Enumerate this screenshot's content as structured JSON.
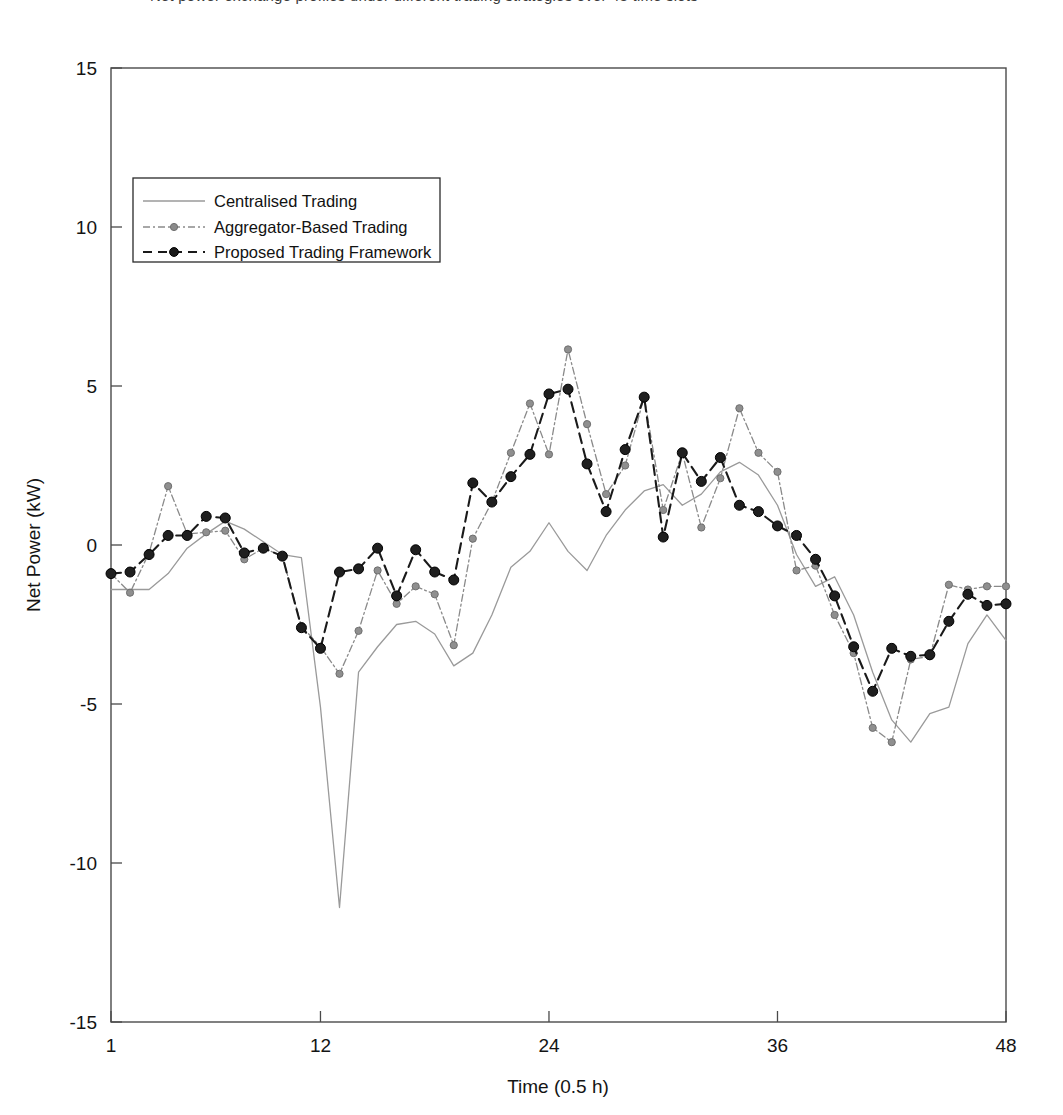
{
  "caption": {
    "text": "Net power exchange profiles under different trading strategies over 48 time slots",
    "visible_state": "cropped-at-top"
  },
  "chart_data": {
    "type": "line",
    "title": "",
    "xlabel": "Time (0.5 h)",
    "ylabel": "Net Power (kW)",
    "xlim": [
      1,
      48
    ],
    "ylim": [
      -15,
      15
    ],
    "xticks": [
      1,
      12,
      24,
      36,
      48
    ],
    "yticks": [
      15,
      10,
      5,
      0,
      -5,
      -10,
      -15
    ],
    "xtick_labels": [
      "1",
      "12",
      "24",
      "36",
      "48"
    ],
    "ytick_labels": [
      "15",
      "10",
      "5",
      "0",
      "-5",
      "-10",
      "-15"
    ],
    "grid": false,
    "legend_position": "upper-left-inside",
    "x": [
      1,
      2,
      3,
      4,
      5,
      6,
      7,
      8,
      9,
      10,
      11,
      12,
      13,
      14,
      15,
      16,
      17,
      18,
      19,
      20,
      21,
      22,
      23,
      24,
      25,
      26,
      27,
      28,
      29,
      30,
      31,
      32,
      33,
      34,
      35,
      36,
      37,
      38,
      39,
      40,
      41,
      42,
      43,
      44,
      45,
      46,
      47,
      48
    ],
    "series": [
      {
        "name": "Centralised Trading",
        "style": "solid",
        "color": "#9a9a9a",
        "marker": "none",
        "values": [
          -1.4,
          -1.4,
          -1.4,
          -0.9,
          -0.1,
          0.35,
          0.75,
          0.5,
          0.1,
          -0.3,
          -0.4,
          -5.1,
          -11.4,
          -4.0,
          -3.2,
          -2.5,
          -2.4,
          -2.8,
          -3.8,
          -3.4,
          -2.2,
          -0.7,
          -0.2,
          0.7,
          -0.2,
          -0.8,
          0.3,
          1.1,
          1.7,
          1.9,
          1.25,
          1.6,
          2.3,
          2.6,
          2.2,
          1.25,
          -0.3,
          -1.3,
          -1.0,
          -2.2,
          -4.0,
          -5.5,
          -6.2,
          -5.3,
          -5.1,
          -3.1,
          -2.2,
          -3.0
        ]
      },
      {
        "name": "Aggregator-Based Trading",
        "style": "dashdot",
        "color": "#8a8a8a",
        "marker": "circle-filled-gray",
        "values": [
          -0.9,
          -1.5,
          -0.25,
          1.85,
          0.35,
          0.4,
          0.45,
          -0.45,
          -0.1,
          -0.35,
          -2.55,
          -3.2,
          -4.05,
          -2.7,
          -0.8,
          -1.85,
          -1.3,
          -1.55,
          -3.15,
          0.2,
          1.35,
          2.9,
          4.45,
          2.85,
          6.15,
          3.8,
          1.6,
          2.5,
          4.65,
          1.1,
          2.9,
          0.55,
          2.1,
          4.3,
          2.9,
          2.3,
          -0.8,
          -0.65,
          -2.2,
          -3.4,
          -5.75,
          -6.2,
          -3.6,
          -3.5,
          -1.25,
          -1.4,
          -1.3,
          -1.3
        ]
      },
      {
        "name": "Proposed Trading Framework",
        "style": "dashed",
        "color": "#1a1a1a",
        "marker": "circle-filled-black",
        "values": [
          -0.9,
          -0.85,
          -0.3,
          0.3,
          0.3,
          0.9,
          0.85,
          -0.25,
          -0.1,
          -0.35,
          -2.6,
          -3.25,
          -0.85,
          -0.75,
          -0.1,
          -1.6,
          -0.15,
          -0.85,
          -1.1,
          1.95,
          1.35,
          2.15,
          2.85,
          4.75,
          4.9,
          2.55,
          1.05,
          3.0,
          4.65,
          0.25,
          2.9,
          2.0,
          2.75,
          1.25,
          1.05,
          0.6,
          0.3,
          -0.45,
          -1.6,
          -3.2,
          -4.6,
          -3.25,
          -3.5,
          -3.45,
          -2.4,
          -1.55,
          -1.9,
          -1.85
        ]
      }
    ]
  },
  "legend": {
    "entries": [
      {
        "label": "Centralised Trading"
      },
      {
        "label": "Aggregator-Based Trading"
      },
      {
        "label": "Proposed Trading Framework"
      }
    ]
  },
  "colors": {
    "centralised": "#9a9a9a",
    "aggregator": "#8a8a8a",
    "proposed": "#1a1a1a",
    "axis": "#4a4a4a",
    "background": "#ffffff"
  }
}
